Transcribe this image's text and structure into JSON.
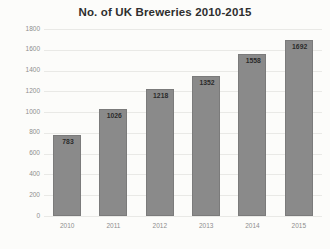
{
  "chart_data": {
    "type": "bar",
    "title": "No. of UK Breweries 2010-2015",
    "xlabel": "",
    "ylabel": "",
    "categories": [
      "2010",
      "2011",
      "2012",
      "2013",
      "2014",
      "2015"
    ],
    "values": [
      783,
      1026,
      1218,
      1352,
      1558,
      1692
    ],
    "value_labels": [
      "783",
      "1026",
      "1218",
      "1352",
      "1558",
      "1692"
    ],
    "ylim": [
      0,
      1800
    ],
    "ytick_step": 200,
    "yticks": [
      "1800",
      "1600",
      "1400",
      "1200",
      "1000",
      "800",
      "600",
      "400",
      "200",
      "0"
    ],
    "ytick_values": [
      1800,
      1600,
      1400,
      1200,
      1000,
      800,
      600,
      400,
      200,
      0
    ],
    "grid": true,
    "grid_axis": "y",
    "legend": false,
    "legend_position": "none",
    "bar_color": "#8a8a8a",
    "bar_border_color": "#7b7b7b",
    "gridline_color": "#e9e9e6",
    "background_color": "#fcfcfa",
    "title_color": "#2e2e2e",
    "tick_label_color": "#8e8e8e",
    "value_label_color": "#2b2b2b"
  }
}
